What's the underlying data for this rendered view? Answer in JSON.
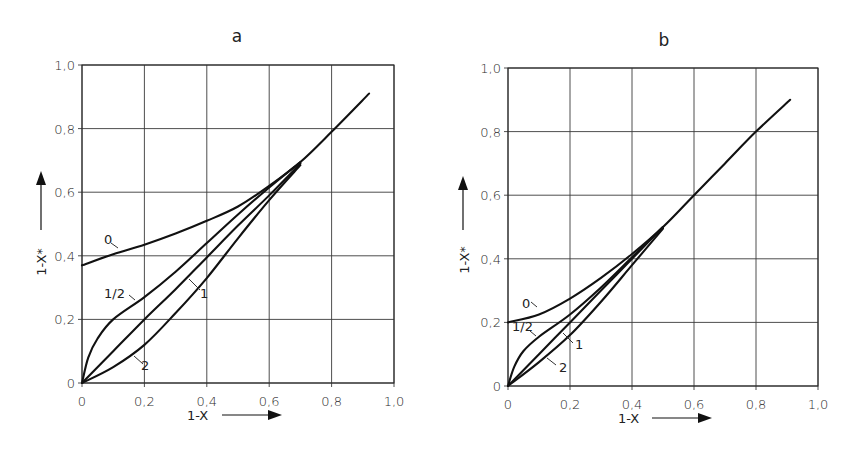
{
  "chart_data": [
    {
      "type": "line",
      "title": "a",
      "xlabel": "1-X",
      "ylabel": "1-X*",
      "xlim": [
        0,
        1.0
      ],
      "ylim": [
        0,
        1.0
      ],
      "grid": true,
      "x_ticks": [
        "0",
        "0,2",
        "0,4",
        "0,6",
        "0,8",
        "1,0"
      ],
      "y_ticks": [
        "0",
        "0,2",
        "0,4",
        "0,6",
        "0,8",
        "1,0"
      ],
      "series": [
        {
          "name": "0",
          "x": [
            0,
            0.1,
            0.2,
            0.3,
            0.4,
            0.5,
            0.6,
            0.7,
            0.8,
            0.92
          ],
          "y": [
            0.37,
            0.405,
            0.435,
            0.47,
            0.51,
            0.555,
            0.62,
            0.695,
            0.79,
            0.91
          ]
        },
        {
          "name": "1/2",
          "x": [
            0,
            0.02,
            0.05,
            0.1,
            0.2,
            0.3,
            0.4,
            0.5,
            0.6,
            0.7
          ],
          "y": [
            0,
            0.08,
            0.14,
            0.2,
            0.27,
            0.35,
            0.44,
            0.53,
            0.615,
            0.695
          ]
        },
        {
          "name": "1",
          "x": [
            0,
            0.1,
            0.2,
            0.3,
            0.4,
            0.5,
            0.6,
            0.7
          ],
          "y": [
            0,
            0.1,
            0.2,
            0.295,
            0.395,
            0.495,
            0.59,
            0.69
          ]
        },
        {
          "name": "2",
          "x": [
            0,
            0.1,
            0.2,
            0.3,
            0.4,
            0.5,
            0.6,
            0.7
          ],
          "y": [
            0,
            0.05,
            0.12,
            0.22,
            0.33,
            0.455,
            0.575,
            0.685
          ]
        }
      ],
      "annotations": [
        "0",
        "1/2",
        "1",
        "2"
      ]
    },
    {
      "type": "line",
      "title": "b",
      "xlabel": "1-X",
      "ylabel": "1-X*",
      "xlim": [
        0,
        1.0
      ],
      "ylim": [
        0,
        1.0
      ],
      "grid": true,
      "x_ticks": [
        "0",
        "0,2",
        "0,4",
        "0,6",
        "0,8",
        "1,0"
      ],
      "y_ticks": [
        "0",
        "0,2",
        "0,4",
        "0,6",
        "0,8",
        "1,0"
      ],
      "series": [
        {
          "name": "0",
          "x": [
            0,
            0.1,
            0.2,
            0.3,
            0.4,
            0.5,
            0.6,
            0.7,
            0.8,
            0.91
          ],
          "y": [
            0.2,
            0.225,
            0.275,
            0.34,
            0.415,
            0.5,
            0.6,
            0.7,
            0.8,
            0.9
          ]
        },
        {
          "name": "1/2",
          "x": [
            0,
            0.02,
            0.05,
            0.1,
            0.2,
            0.3,
            0.4,
            0.5
          ],
          "y": [
            0,
            0.06,
            0.11,
            0.155,
            0.225,
            0.31,
            0.405,
            0.5
          ]
        },
        {
          "name": "1",
          "x": [
            0,
            0.1,
            0.2,
            0.3,
            0.4,
            0.5
          ],
          "y": [
            0,
            0.1,
            0.2,
            0.3,
            0.4,
            0.5
          ]
        },
        {
          "name": "2",
          "x": [
            0,
            0.1,
            0.2,
            0.3,
            0.4,
            0.5
          ],
          "y": [
            0,
            0.075,
            0.16,
            0.265,
            0.38,
            0.495
          ]
        }
      ],
      "annotations": [
        "0",
        "1/2",
        "1",
        "2"
      ]
    }
  ],
  "panels": {
    "a": {
      "title": "a",
      "xlabel": "1-X",
      "ylabel": "1-X*"
    },
    "b": {
      "title": "b",
      "xlabel": "1-X",
      "ylabel": "1-X*"
    }
  }
}
